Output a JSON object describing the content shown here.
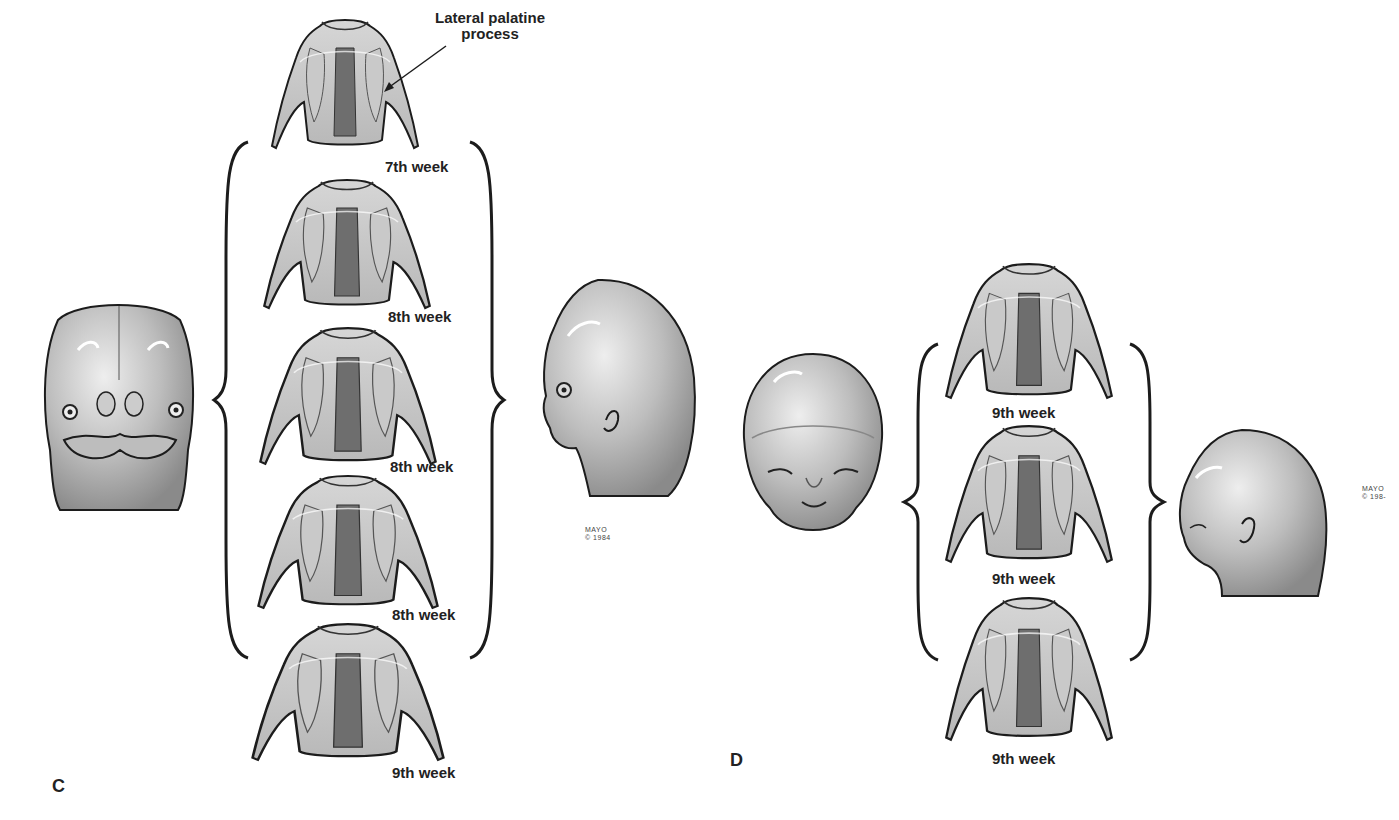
{
  "figure": {
    "panels": [
      {
        "letter": "C",
        "callout": {
          "line1": "Lateral palatine",
          "line2": "process"
        },
        "stages": [
          {
            "label": "7th week"
          },
          {
            "label": "8th week"
          },
          {
            "label": "8th week"
          },
          {
            "label": "8th week"
          },
          {
            "label": "9th week"
          }
        ],
        "mark": {
          "line1": "MAYO",
          "line2": "© 1984"
        },
        "left_view": "frontal-face-embryo",
        "right_view": "lateral-head-embryo"
      },
      {
        "letter": "D",
        "stages": [
          {
            "label": "9th week"
          },
          {
            "label": "9th week"
          },
          {
            "label": "9th week"
          }
        ],
        "mark": {
          "line1": "MAYO",
          "line2": "© 198-"
        },
        "left_view": "frontal-face-fetus",
        "right_view": "lateral-head-fetus"
      }
    ],
    "colors": {
      "line": "#1c1c1c",
      "shade_light": "#d9d9d9",
      "shade_mid": "#a9a9a9",
      "shade_dark": "#5a5a5a",
      "background": "#ffffff"
    }
  }
}
